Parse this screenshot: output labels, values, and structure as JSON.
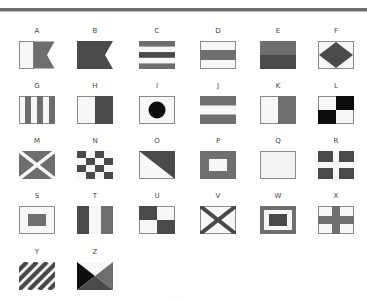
{
  "colors": {
    "dark": "#4a4a4a",
    "mid": "#6e6e6e",
    "black": "#0d0d0d",
    "white": "#f7f7f7",
    "border": "#8a8a8a",
    "rule": "#6f6f6f"
  },
  "flags": [
    {
      "letter": "A",
      "design": "white hoist, dark swallowtail fly"
    },
    {
      "letter": "B",
      "design": "solid dark swallowtail"
    },
    {
      "letter": "C",
      "design": "five horizontal stripes dark-white-dark-white-dark"
    },
    {
      "letter": "D",
      "design": "light-dark-light horizontal bands"
    },
    {
      "letter": "E",
      "design": "medium top half, dark bottom half"
    },
    {
      "letter": "F",
      "design": "dark diamond on white"
    },
    {
      "letter": "G",
      "design": "six vertical stripes white/dark alternating"
    },
    {
      "letter": "H",
      "design": "white hoist, dark fly vertical halves"
    },
    {
      "letter": "I",
      "design": "black circle on white"
    },
    {
      "letter": "J",
      "design": "dark-white-dark horizontal bands"
    },
    {
      "letter": "K",
      "design": "white hoist, medium fly vertical halves"
    },
    {
      "letter": "L",
      "design": "quartered white/black checks"
    },
    {
      "letter": "M",
      "design": "white saltire on dark field"
    },
    {
      "letter": "N",
      "design": "dark and white checkerboard 4x4"
    },
    {
      "letter": "O",
      "design": "diagonal: white lower-left, dark upper-right"
    },
    {
      "letter": "P",
      "design": "dark field with white rectangle centre"
    },
    {
      "letter": "Q",
      "design": "plain light field"
    },
    {
      "letter": "R",
      "design": "dark field with white cross"
    },
    {
      "letter": "S",
      "design": "white field with dark rectangle centre"
    },
    {
      "letter": "T",
      "design": "dark-white-medium vertical tricolour"
    },
    {
      "letter": "U",
      "design": "quartered dark/white checks"
    },
    {
      "letter": "V",
      "design": "dark saltire on white field"
    },
    {
      "letter": "W",
      "design": "dark border, white band, dark centre"
    },
    {
      "letter": "X",
      "design": "white field with dark cross"
    },
    {
      "letter": "Y",
      "design": "diagonal dark and white stripes"
    },
    {
      "letter": "Z",
      "design": "four triangles: white top, black left, medium right, dark bottom"
    }
  ],
  "caption": "· · · ·"
}
